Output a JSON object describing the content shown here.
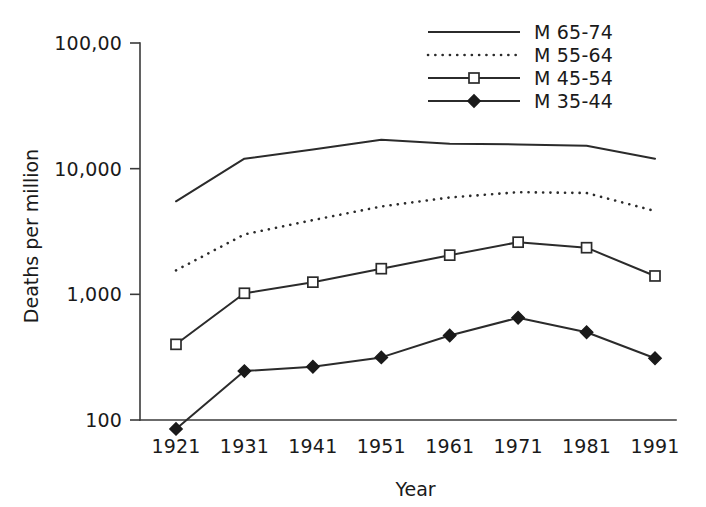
{
  "chart_data": {
    "type": "line",
    "title": "",
    "xlabel": "Year",
    "ylabel": "Deaths per million",
    "x": [
      1921,
      1931,
      1941,
      1951,
      1961,
      1971,
      1981,
      1991
    ],
    "xtick_labels": [
      "1921",
      "1931",
      "1941",
      "1951",
      "1961",
      "1971",
      "1981",
      "1991"
    ],
    "ytick_labels": [
      "100,00",
      "10,000",
      "1,000",
      "100"
    ],
    "ytick_values": [
      100000,
      10000,
      1000,
      100
    ],
    "yscale": "log",
    "ylim": [
      100,
      100000
    ],
    "grid": false,
    "legend_position": "top-right",
    "series": [
      {
        "name": "M 65-74",
        "style": "solid",
        "marker": "none",
        "values": [
          5500,
          12000,
          14200,
          17000,
          15800,
          15600,
          15200,
          12000
        ]
      },
      {
        "name": "M 55-64",
        "style": "dotted",
        "marker": "none",
        "values": [
          1550,
          3000,
          3900,
          5000,
          5900,
          6500,
          6400,
          4600
        ]
      },
      {
        "name": "M 45-54",
        "style": "solid",
        "marker": "open-square",
        "values": [
          400,
          1020,
          1250,
          1600,
          2050,
          2600,
          2350,
          1400
        ]
      },
      {
        "name": "M 35-44",
        "style": "solid",
        "marker": "filled-diamond",
        "values": [
          85,
          245,
          265,
          315,
          470,
          650,
          500,
          310
        ]
      }
    ]
  },
  "legend": {
    "entries": [
      {
        "label": "M 65-74"
      },
      {
        "label": "M 55-64"
      },
      {
        "label": "M 45-54"
      },
      {
        "label": "M 35-44"
      }
    ]
  }
}
